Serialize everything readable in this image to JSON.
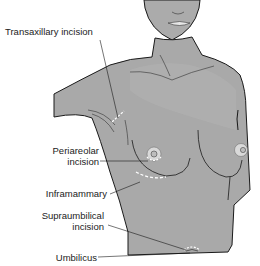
{
  "diagram": {
    "type": "anatomical illustration",
    "colors": {
      "skin": "#a9a9a9",
      "skin_light": "#b5b5b5",
      "skin_shadow": "#999999",
      "outline": "#1a1a1a",
      "areola": "#d9d9d9",
      "background": "#ffffff"
    },
    "labels": [
      {
        "id": "transaxillary",
        "text": "Transaxillary incision"
      },
      {
        "id": "periareolar_1",
        "text": "Periareolar"
      },
      {
        "id": "periareolar_2",
        "text": "incision"
      },
      {
        "id": "inframammary",
        "text": "Inframammary"
      },
      {
        "id": "supraumbilical_1",
        "text": "Supraumbilical"
      },
      {
        "id": "supraumbilical_2",
        "text": "incision"
      },
      {
        "id": "umbilicus",
        "text": "Umbilicus"
      }
    ]
  }
}
